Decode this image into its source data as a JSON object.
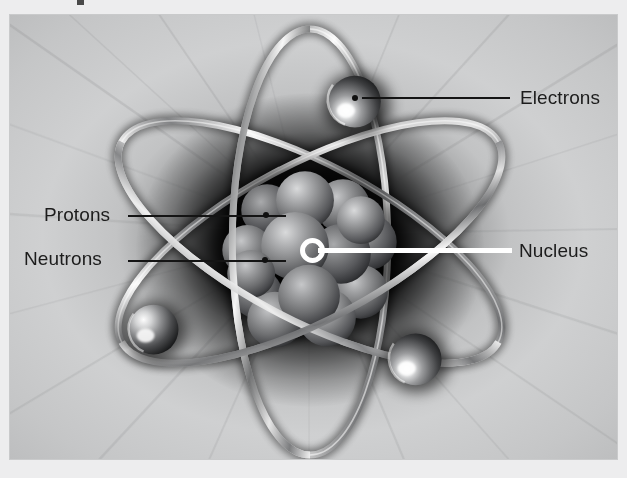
{
  "page": {
    "background_color": "#ededee",
    "frame_border_color": "#c9cacb"
  },
  "figure": {
    "name": "atom-structure-diagram",
    "style": "grayscale 3D rendered atom with orbital rings",
    "background": {
      "type": "radial-burst",
      "center_color": "#101010",
      "outer_color": "#cdcecf"
    },
    "labels": [
      {
        "id": "electrons",
        "text": "Electrons",
        "leader_color": "#141414",
        "text_color": "#1c1c1c"
      },
      {
        "id": "nucleus",
        "text": "Nucleus",
        "leader_color": "#ffffff",
        "text_color": "#1c1c1c"
      },
      {
        "id": "protons",
        "text": "Protons",
        "leader_color": "#141414",
        "text_color": "#1c1c1c"
      },
      {
        "id": "neutrons",
        "text": "Neutrons",
        "leader_color": "#141414",
        "text_color": "#1c1c1c"
      }
    ],
    "electron_count": 3,
    "orbit_count": 3,
    "nucleus_particle_count": 14
  }
}
